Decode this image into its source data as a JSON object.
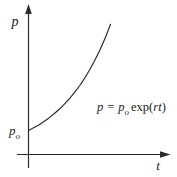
{
  "figure": {
    "background": "#ffffff",
    "line_color": "#2b2b2b",
    "text_color": "#1c1c1c"
  },
  "axes": {
    "y_label": "p",
    "x_label": "t",
    "y_intercept": {
      "base": "p",
      "sub": "o"
    }
  },
  "equation": {
    "lhs": "p",
    "equals": "=",
    "base": "p",
    "sub": "o",
    "func": "exp(",
    "arg": "rt",
    "close": ")"
  },
  "chart_data": {
    "type": "line",
    "title": "",
    "xlabel": "t",
    "ylabel": "p",
    "annotation": "p = p_o exp(rt)",
    "y_intercept_label": "p_o",
    "grid": false,
    "tick_labels": "none",
    "curve": {
      "t_normalized": [
        0,
        0.0625,
        0.125,
        0.1875,
        0.25,
        0.3125,
        0.375,
        0.4375,
        0.5,
        0.5625,
        0.625,
        0.6875,
        0.75,
        0.8125,
        0.875,
        0.9375,
        1.0
      ],
      "p_over_p0": [
        1.0,
        1.1114,
        1.2353,
        1.3729,
        1.5258,
        1.6957,
        1.8848,
        2.0946,
        2.3279,
        2.5871,
        2.8756,
        3.1959,
        3.5521,
        3.9475,
        4.3878,
        4.8762,
        5.4195
      ]
    }
  }
}
